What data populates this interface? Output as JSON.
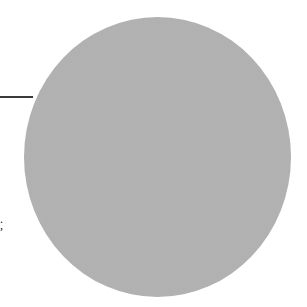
{
  "figure": {
    "shape": "circle",
    "fill_color": "#b9b9b9",
    "texture": "stippled-halftone",
    "leader_line_color": "#3a3a3a"
  },
  "text_fragments": [
    {
      "text": "."
    },
    {
      "text": ","
    }
  ]
}
